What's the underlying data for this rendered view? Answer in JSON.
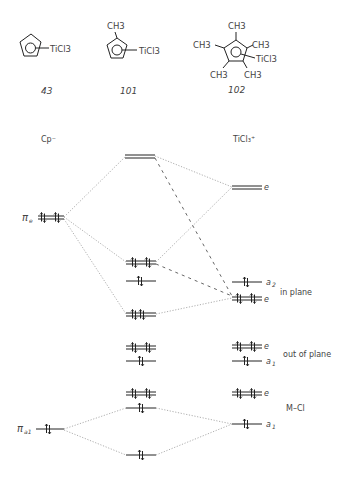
{
  "compounds": [
    {
      "id": "43",
      "label": "43",
      "ligand": "TiCl3",
      "substituents": []
    },
    {
      "id": "101",
      "label": "101",
      "ligand": "TiCl3",
      "substituents": [
        "CH3"
      ]
    },
    {
      "id": "102",
      "label": "102",
      "ligand": "TiCl3",
      "substituents": [
        "CH3",
        "CH3",
        "CH3",
        "CH3",
        "CH3"
      ]
    }
  ],
  "columns": {
    "left": "Cp⁻",
    "right": "TiCl₃⁺"
  },
  "left_levels": [
    {
      "label": "πe",
      "main": "π",
      "sub": "e",
      "electrons": 4
    },
    {
      "label": "πa1",
      "main": "π",
      "sub": "a1",
      "electrons": 2
    }
  ],
  "right_levels": [
    {
      "sym": "e",
      "electrons": 0
    },
    {
      "sym": "a2",
      "electrons": 2
    },
    {
      "sym": "e",
      "electrons": 4
    },
    {
      "sym": "e",
      "electrons": 4
    },
    {
      "sym": "a1",
      "electrons": 2
    },
    {
      "sym": "e",
      "electrons": 4
    },
    {
      "sym": "a1",
      "electrons": 2
    }
  ],
  "group_labels": {
    "in_plane": "in plane",
    "out_of_plane": "out of plane",
    "m_cl": "M–Cl"
  },
  "text": {
    "ch3": "CH3",
    "ticl3": "TiCl3",
    "e": "e",
    "a": "a",
    "sub1": "1",
    "sub2": "2",
    "pi": "π",
    "pi_e_sub": "e",
    "pi_a1_sub": "a1",
    "cp": "Cp",
    "cp_sup": "−",
    "ticl": "TiCl",
    "ticl_sub": "3",
    "ticl_sup": "+"
  }
}
